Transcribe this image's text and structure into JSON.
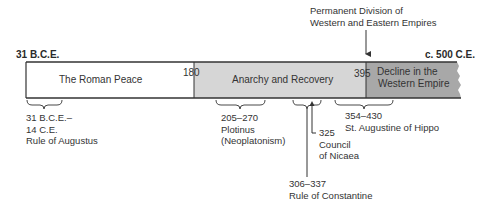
{
  "timeline": {
    "start_label": "31 B.C.E.",
    "end_label": "c. 500 C.E.",
    "colors": {
      "segment_1": "#ffffff",
      "segment_2": "#d6d6d6",
      "segment_3": "#a8a8a8",
      "outline": "#333333"
    },
    "segments": [
      {
        "label": "The Roman Peace"
      },
      {
        "start_year": "180",
        "label": "Anarchy and Recovery"
      },
      {
        "start_year": "395",
        "label_line1": "Decline in the",
        "label_line2": "Western Empire"
      }
    ],
    "top_annotation": {
      "line1": "Permanent Division of",
      "line2": "Western and Eastern Empires"
    },
    "events": [
      {
        "dates_line1": "31 B.C.E.–",
        "dates_line2": "14 C.E.",
        "label": "Rule of Augustus"
      },
      {
        "dates": "205–270",
        "label_line1": "Plotinus",
        "label_line2": "(Neoplatonism)"
      },
      {
        "dates": "325",
        "label_line1": "Council",
        "label_line2": "of Nicaea"
      },
      {
        "dates": "306–337",
        "label": "Rule of Constantine"
      },
      {
        "dates": "354–430",
        "label": "St. Augustine of Hippo"
      }
    ]
  }
}
